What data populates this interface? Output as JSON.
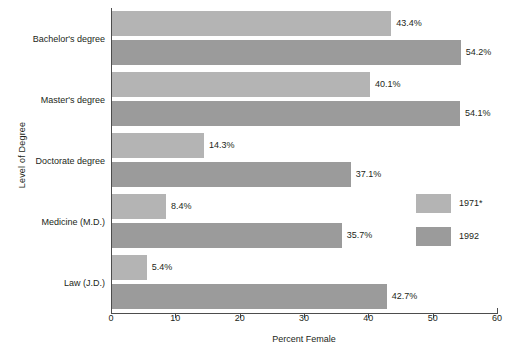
{
  "chart_data": {
    "type": "bar",
    "orientation": "horizontal",
    "title": "",
    "xlabel": "Percent Female",
    "ylabel": "Level of Degree",
    "xlim": [
      0,
      60
    ],
    "xticks": [
      0,
      10,
      20,
      30,
      40,
      50,
      60
    ],
    "xtick_labels": [
      "0",
      "10",
      "20",
      "30",
      "40",
      "50",
      "60"
    ],
    "grid": false,
    "legend_position": "right-middle",
    "categories": [
      "Bachelor's degree",
      "Master's degree",
      "Doctorate degree",
      "Medicine (M.D.)",
      "Law (J.D.)"
    ],
    "series": [
      {
        "name": "1971*",
        "color": "#b4b4b4",
        "values": [
          43.4,
          40.1,
          14.3,
          8.4,
          5.4
        ],
        "value_labels": [
          "43.4%",
          "40.1%",
          "14.3%",
          "8.4%",
          "5.4%"
        ]
      },
      {
        "name": "1992",
        "color": "#9b9b9b",
        "values": [
          54.2,
          54.1,
          37.1,
          35.7,
          42.7
        ],
        "value_labels": [
          "54.2%",
          "54.1%",
          "37.1%",
          "35.7%",
          "42.7%"
        ]
      }
    ]
  },
  "legend": {
    "items": [
      {
        "label": "1971*",
        "color": "#b4b4b4"
      },
      {
        "label": "1992",
        "color": "#9b9b9b"
      }
    ]
  },
  "axes": {
    "x_title": "Percent Female",
    "y_title": "Level of Degree"
  }
}
